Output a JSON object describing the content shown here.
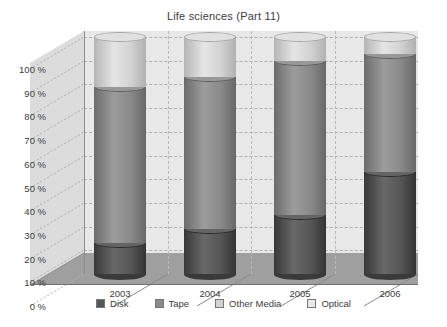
{
  "chart_data": {
    "type": "bar",
    "subtype": "stacked-100-percent-3d-cylinder",
    "title": "Life sciences (Part 11)",
    "xlabel": "",
    "ylabel": "",
    "categories": [
      "2003",
      "2004",
      "2005",
      "2006"
    ],
    "ylim": [
      0,
      100
    ],
    "ytick_labels": [
      "0 %",
      "10 %",
      "20 %",
      "30 %",
      "40 %",
      "50 %",
      "60 %",
      "70 %",
      "80 %",
      "90 %",
      "100 %"
    ],
    "ytick_values": [
      0,
      10,
      20,
      30,
      40,
      50,
      60,
      70,
      80,
      90,
      100
    ],
    "grid": true,
    "legend_position": "bottom",
    "series": [
      {
        "name": "Disk",
        "color": "#565656",
        "values": [
          13,
          19,
          25,
          43
        ]
      },
      {
        "name": "Tape",
        "color": "#8a8a8a",
        "values": [
          66,
          64,
          65,
          50
        ]
      },
      {
        "name": "Other Media",
        "color": "#d3d3d3",
        "values": [
          21,
          17,
          10,
          7
        ]
      },
      {
        "name": "Optical",
        "color": "#e9e9e9",
        "values": [
          0,
          0,
          0,
          0
        ]
      }
    ],
    "stack_tops": {
      "Disk": [
        13,
        19,
        25,
        43
      ],
      "Tape": [
        79,
        83,
        90,
        93
      ],
      "Other Media": [
        100,
        100,
        100,
        100
      ],
      "Optical": [
        100,
        100,
        100,
        100
      ]
    }
  },
  "legend": {
    "items": [
      {
        "label": "Disk",
        "color": "#565656"
      },
      {
        "label": "Tape",
        "color": "#8a8a8a"
      },
      {
        "label": "Other Media",
        "color": "#d3d3d3"
      },
      {
        "label": "Optical",
        "color": "#e9e9e9"
      }
    ]
  },
  "colors": {
    "plot_wall": "#e8e8e8",
    "plot_floor": "#9f9f9f",
    "side_wall": "#dcdcdc",
    "gridline": "#b0b0b0",
    "axis": "#8d8d8d",
    "text": "#3c3c3c",
    "background": "#ffffff"
  }
}
